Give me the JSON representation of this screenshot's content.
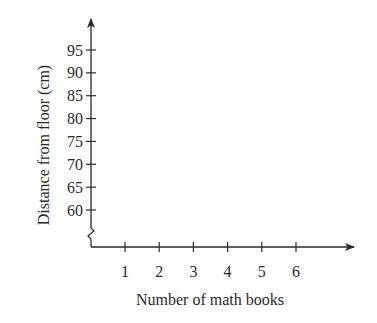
{
  "chart_data": {
    "type": "scatter",
    "title": "",
    "xlabel": "Number of math books",
    "ylabel": "Distance from floor (cm)",
    "x_ticks": [
      1,
      2,
      3,
      4,
      5,
      6
    ],
    "y_ticks": [
      60,
      65,
      70,
      75,
      80,
      85,
      90,
      95
    ],
    "xlim": [
      0,
      7.5
    ],
    "ylim": [
      55,
      100
    ],
    "y_axis_break": true,
    "grid": false,
    "legend": null,
    "series": [],
    "colors": {
      "axis": "#2a2a2a",
      "background": "#ffffff"
    }
  }
}
